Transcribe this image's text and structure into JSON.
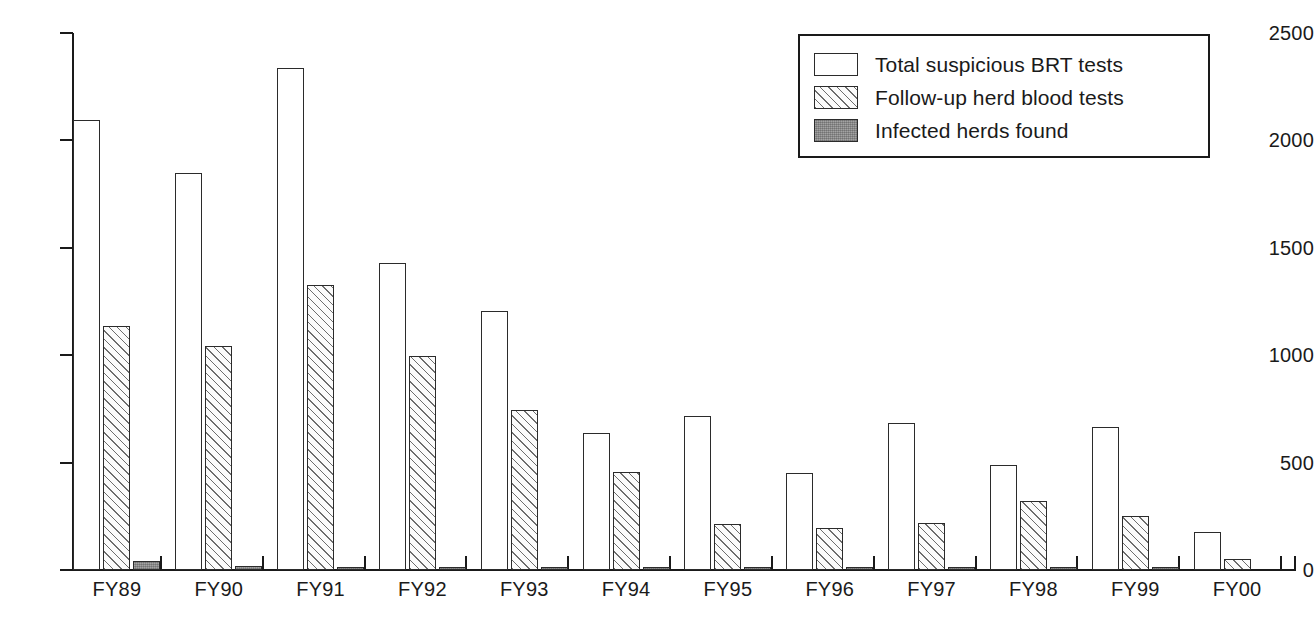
{
  "chart_data": {
    "type": "bar",
    "title": "",
    "xlabel": "",
    "ylabel": "",
    "ylim": [
      0,
      2500
    ],
    "yticks": [
      0,
      500,
      1000,
      1500,
      2000,
      2500
    ],
    "ytick_labels": [
      "0",
      "500",
      "1000",
      "1500",
      "2000",
      "2500"
    ],
    "grid": false,
    "legend_position": "top-right",
    "categories": [
      "FY89",
      "FY90",
      "FY91",
      "FY92",
      "FY93",
      "FY94",
      "FY95",
      "FY96",
      "FY97",
      "FY98",
      "FY99",
      "FY00"
    ],
    "series": [
      {
        "name": "Total suspicious BRT tests",
        "style": "white",
        "values": [
          2095,
          1850,
          2335,
          1430,
          1205,
          640,
          715,
          450,
          685,
          490,
          665,
          175
        ]
      },
      {
        "name": "Follow-up herd blood tests",
        "style": "hatched",
        "values": [
          1135,
          1045,
          1325,
          995,
          745,
          455,
          215,
          195,
          220,
          320,
          250,
          50
        ]
      },
      {
        "name": "Infected herds found",
        "style": "solid-gray",
        "values": [
          40,
          17,
          10,
          5,
          4,
          2,
          2,
          2,
          2,
          2,
          1,
          0
        ]
      }
    ]
  },
  "legend": {
    "items": [
      {
        "label": "Total suspicious BRT tests",
        "swatch": "white-swatch"
      },
      {
        "label": "Follow-up herd blood tests",
        "swatch": "hatched-swatch"
      },
      {
        "label": "Infected herds found",
        "swatch": "gray-swatch"
      }
    ]
  },
  "colors": {
    "axis": "#1a1a1a",
    "bar_outline": "#2b2b2b",
    "infected_fill": "#8c8c8c",
    "hatch_line": "#6d6d6d",
    "background": "#ffffff"
  }
}
